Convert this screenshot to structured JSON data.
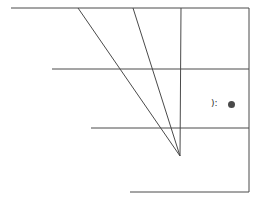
{
  "canvas": {
    "width": 260,
    "height": 205,
    "background": "#ffffff",
    "stroke_color": "#4a4a4a",
    "stroke_width": 1
  },
  "figure": {
    "title": "",
    "type": "line-drawing",
    "outline": {
      "name": "trapezoid-outline",
      "points": "11,8 249,8 249,192 130,192"
    },
    "segments": [
      {
        "name": "top-edge",
        "x1": 11,
        "y1": 8,
        "x2": 249,
        "y2": 8
      },
      {
        "name": "right-edge",
        "x1": 249,
        "y1": 8,
        "x2": 249,
        "y2": 192
      },
      {
        "name": "bottom-edge",
        "x1": 130,
        "y1": 192,
        "x2": 249,
        "y2": 192
      },
      {
        "name": "left-diagonal-edge",
        "x1": 11,
        "y1": 8,
        "x2": 130,
        "y2": 192
      },
      {
        "name": "horizontal-band-upper",
        "x1": 52,
        "y1": 69,
        "x2": 249,
        "y2": 69
      },
      {
        "name": "horizontal-band-lower",
        "x1": 91,
        "y1": 128,
        "x2": 249,
        "y2": 128
      },
      {
        "name": "vertical-axis-line",
        "x1": 181,
        "y1": 8,
        "x2": 180,
        "y2": 156
      },
      {
        "name": "converging-diagonal-left",
        "x1": 78,
        "y1": 8,
        "x2": 180,
        "y2": 156
      },
      {
        "name": "converging-diagonal-right",
        "x1": 133,
        "y1": 8,
        "x2": 180,
        "y2": 156
      }
    ],
    "vertex_label": ""
  },
  "marks": {
    "glyph": {
      "name": "paren-colon-glyph",
      "text": "):",
      "x": 211,
      "y": 99
    },
    "dot": {
      "name": "filled-dot-marker",
      "x": 228,
      "y": 101,
      "diameter": 7,
      "color": "#4a4a4a"
    }
  }
}
